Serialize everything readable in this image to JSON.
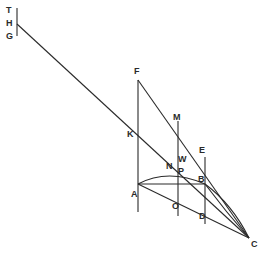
{
  "diagram": {
    "type": "geometric-construction",
    "ink_color": "#2a2a2a",
    "background": "#ffffff",
    "labels": {
      "T": "T",
      "H": "H",
      "G": "G",
      "F": "F",
      "K": "K",
      "M": "M",
      "E": "E",
      "N": "N",
      "W": "W",
      "P": "P",
      "B": "B",
      "A": "A",
      "O": "O",
      "D": "D",
      "C": "C"
    },
    "points": {
      "T": [
        17,
        9
      ],
      "H": [
        17,
        24
      ],
      "G": [
        17,
        35
      ],
      "F": [
        138,
        80
      ],
      "K": [
        138,
        131
      ],
      "M": [
        178,
        121
      ],
      "E": [
        205,
        157
      ],
      "W": [
        181,
        160
      ],
      "N": [
        173,
        164
      ],
      "P": [
        181,
        170
      ],
      "B": [
        205,
        182
      ],
      "A": [
        138,
        212
      ],
      "O": [
        178,
        216
      ],
      "D": [
        205,
        224
      ],
      "C": [
        249,
        238
      ]
    },
    "segments": [
      [
        "T",
        "G"
      ],
      [
        "H",
        "C"
      ],
      [
        "F",
        "A"
      ],
      [
        "F",
        "C"
      ],
      [
        "M",
        "O"
      ],
      [
        "E",
        "D"
      ],
      [
        "A",
        "B"
      ],
      [
        "A",
        "C"
      ],
      [
        "B",
        "C"
      ]
    ],
    "arcs": [
      [
        "A",
        "B"
      ]
    ]
  }
}
